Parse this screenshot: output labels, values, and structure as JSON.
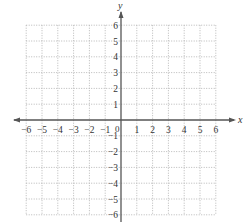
{
  "diagram": {
    "type": "coordinate-plane",
    "x_axis": {
      "label": "x",
      "min": -6,
      "max": 6,
      "ticks": [
        "-6",
        "-5",
        "-4",
        "-3",
        "-2",
        "-1",
        "1",
        "2",
        "3",
        "4",
        "5",
        "6"
      ]
    },
    "y_axis": {
      "label": "y",
      "min": -6,
      "max": 6,
      "ticks": [
        "6",
        "5",
        "4",
        "3",
        "2",
        "1",
        "-1",
        "-2",
        "-3",
        "-4",
        "-5",
        "-6"
      ]
    },
    "origin_label": "0",
    "grid": {
      "style": "dotted",
      "color": "#b8b8b8"
    },
    "axis_color": "#555555"
  },
  "chart_data": {
    "type": "scatter",
    "title": "",
    "xlabel": "x",
    "ylabel": "y",
    "xlim": [
      -6,
      6
    ],
    "ylim": [
      -6,
      6
    ],
    "grid": true,
    "series": []
  }
}
